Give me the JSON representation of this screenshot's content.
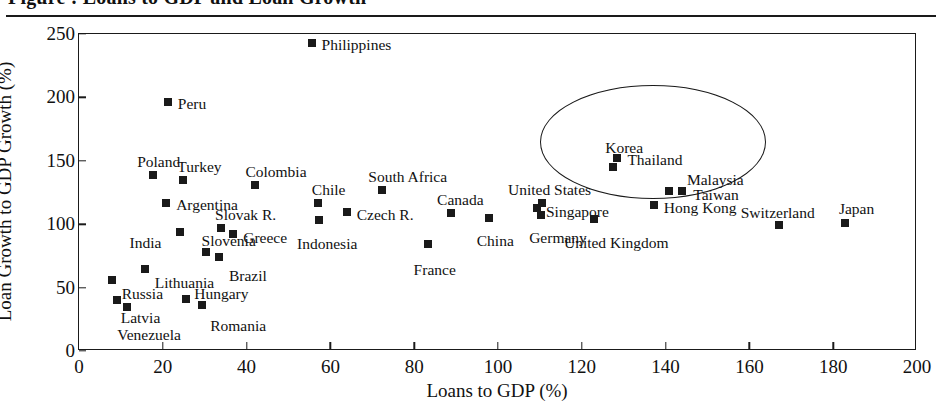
{
  "figure": {
    "cropped_title": "Figure : Loans to GDP and Loan Growth",
    "xlabel": "Loans to GDP (%)",
    "ylabel": "Loan Growth to GDP Growth (%)"
  },
  "chart_data": {
    "type": "scatter",
    "title": "",
    "xlabel": "Loans to GDP (%)",
    "ylabel": "Loan Growth to GDP Growth (%)",
    "xlim": [
      0,
      200
    ],
    "ylim": [
      0,
      250
    ],
    "xticks": [
      0,
      20,
      40,
      60,
      80,
      100,
      120,
      140,
      160,
      180,
      200
    ],
    "yticks": [
      0,
      50,
      100,
      150,
      200,
      250
    ],
    "grid": false,
    "legend": "none",
    "annotations": [
      {
        "type": "ellipse",
        "note": "hand-drawn oval highlighting East/Southeast Asian economies",
        "encloses": [
          "Korea",
          "Thailand",
          "Malaysia",
          "Taiwan",
          "Hong Kong"
        ],
        "center_x": 137,
        "center_y": 165,
        "radius_x": 27,
        "radius_y": 45
      }
    ],
    "points": [
      {
        "label": "Philippines",
        "x": 55.5,
        "y": 243,
        "label_dx": 10,
        "label_dy": -6
      },
      {
        "label": "Peru",
        "x": 21.2,
        "y": 196,
        "label_dx": 10,
        "label_dy": -6
      },
      {
        "label": "Poland",
        "x": 17.7,
        "y": 139,
        "label_dx": -16,
        "label_dy": -21
      },
      {
        "label": "Turkey",
        "x": 24.9,
        "y": 135,
        "label_dx": -6,
        "label_dy": -21
      },
      {
        "label": "Colombia",
        "x": 42.1,
        "y": 131,
        "label_dx": -10,
        "label_dy": -21
      },
      {
        "label": "South Africa",
        "x": 72.4,
        "y": 127,
        "label_dx": -14,
        "label_dy": -21
      },
      {
        "label": "Argentina",
        "x": 20.8,
        "y": 117,
        "label_dx": 10,
        "label_dy": -6
      },
      {
        "label": "Chile",
        "x": 57.0,
        "y": 117,
        "label_dx": -6,
        "label_dy": -21
      },
      {
        "label": "Thailand",
        "x": 128.5,
        "y": 152,
        "label_dx": 10,
        "label_dy": -6
      },
      {
        "label": "Korea",
        "x": 127.5,
        "y": 145,
        "label_dx": -8,
        "label_dy": -27
      },
      {
        "label": "Malaysia",
        "x": 140.8,
        "y": 126,
        "label_dx": 18,
        "label_dy": -19
      },
      {
        "label": "Taiwan",
        "x": 144.0,
        "y": 126,
        "label_dx": 11,
        "label_dy": -4
      },
      {
        "label": "Czech R.",
        "x": 63.9,
        "y": 110,
        "label_dx": 10,
        "label_dy": -5
      },
      {
        "label": "Canada",
        "x": 88.8,
        "y": 109,
        "label_dx": -14,
        "label_dy": -21
      },
      {
        "label": "United States",
        "x": 110.5,
        "y": 117,
        "label_dx": -34,
        "label_dy": -21
      },
      {
        "label": "Singapore",
        "x": 109.3,
        "y": 113,
        "label_dx": 9,
        "label_dy": -4
      },
      {
        "label": "Germany",
        "x": 110.3,
        "y": 107,
        "label_dx": -12,
        "label_dy": 15
      },
      {
        "label": "Hong Kong",
        "x": 137.2,
        "y": 115,
        "label_dx": 10,
        "label_dy": -5
      },
      {
        "label": "United Kingdom",
        "x": 122.9,
        "y": 104,
        "label_dx": -30,
        "label_dy": 16
      },
      {
        "label": "China",
        "x": 97.8,
        "y": 105,
        "label_dx": -12,
        "label_dy": 15
      },
      {
        "label": "Switzerland",
        "x": 167.0,
        "y": 99,
        "label_dx": -38,
        "label_dy": -20
      },
      {
        "label": "Japan",
        "x": 182.8,
        "y": 101,
        "label_dx": -6,
        "label_dy": -22
      },
      {
        "label": "Indonesia",
        "x": 57.3,
        "y": 103,
        "label_dx": -22,
        "label_dy": 16
      },
      {
        "label": "Slovak R.",
        "x": 33.9,
        "y": 97,
        "label_dx": -6,
        "label_dy": -21
      },
      {
        "label": "Greece",
        "x": 36.8,
        "y": 92,
        "label_dx": 10,
        "label_dy": -4
      },
      {
        "label": "India",
        "x": 24.0,
        "y": 94,
        "label_dx": -50,
        "label_dy": 3
      },
      {
        "label": "France",
        "x": 83.2,
        "y": 84,
        "label_dx": -14,
        "label_dy": 18
      },
      {
        "label": "Slovenia",
        "x": 30.2,
        "y": 78,
        "label_dx": -4,
        "label_dy": -19
      },
      {
        "label": "Brazil",
        "x": 33.4,
        "y": 74,
        "label_dx": 10,
        "label_dy": 11
      },
      {
        "label": "Lithuania",
        "x": 15.7,
        "y": 65,
        "label_dx": 10,
        "label_dy": 6
      },
      {
        "label": "Russia",
        "x": 7.8,
        "y": 56,
        "label_dx": 10,
        "label_dy": 6
      },
      {
        "label": "Hungary",
        "x": 25.6,
        "y": 41,
        "label_dx": 8,
        "label_dy": -13
      },
      {
        "label": "Latvia",
        "x": 9.0,
        "y": 40,
        "label_dx": 4,
        "label_dy": 10
      },
      {
        "label": "Venezuela",
        "x": 11.5,
        "y": 35,
        "label_dx": -10,
        "label_dy": 20
      },
      {
        "label": "Romania",
        "x": 29.4,
        "y": 36,
        "label_dx": 8,
        "label_dy": 13
      }
    ]
  },
  "colors": {
    "marker": "#1a1a1a",
    "axis": "#1a1a1a",
    "background": "#ffffff"
  }
}
